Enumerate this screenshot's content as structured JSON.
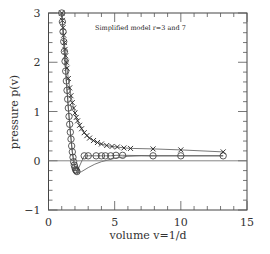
{
  "chart_data": {
    "type": "line",
    "title": "",
    "annotation": "Simplified  model r=3 and 7",
    "xlabel": "volume   v=1/d",
    "ylabel": "pressure   p(v)",
    "xlim": [
      0,
      15
    ],
    "ylim": [
      -1,
      3
    ],
    "xticks": [
      "0",
      "5",
      "10",
      "15"
    ],
    "yticks": [
      "-1",
      "0",
      "1",
      "2",
      "3"
    ],
    "grid": false,
    "legend": null,
    "series": [
      {
        "name": "r=7 (crosses)",
        "marker": "x",
        "x": [
          1.0,
          1.05,
          1.1,
          1.15,
          1.2,
          1.25,
          1.3,
          1.35,
          1.4,
          1.5,
          1.6,
          1.7,
          1.8,
          1.9,
          2.0,
          2.1,
          2.2,
          2.35,
          2.5,
          2.7,
          2.9,
          3.1,
          3.4,
          3.7,
          4.0,
          4.4,
          4.8,
          5.2,
          5.7,
          6.2,
          7.9,
          10.0,
          13.2
        ],
        "y": [
          3.0,
          2.85,
          2.7,
          2.55,
          2.4,
          2.26,
          2.13,
          2.0,
          1.88,
          1.67,
          1.48,
          1.32,
          1.18,
          1.07,
          0.97,
          0.88,
          0.81,
          0.72,
          0.65,
          0.57,
          0.51,
          0.46,
          0.41,
          0.37,
          0.34,
          0.31,
          0.29,
          0.28,
          0.26,
          0.25,
          0.24,
          0.22,
          0.18
        ]
      },
      {
        "name": "r=3 (circles)",
        "marker": "o",
        "x": [
          1.0,
          1.05,
          1.1,
          1.15,
          1.2,
          1.25,
          1.3,
          1.35,
          1.4,
          1.45,
          1.5,
          1.55,
          1.6,
          1.65,
          1.7,
          1.75,
          1.8,
          1.85,
          1.9,
          1.95,
          2.0,
          2.05,
          2.1,
          2.15,
          2.7,
          3.0,
          3.6,
          4.0,
          4.3,
          4.7,
          5.1,
          5.6,
          7.9,
          10.0,
          13.2
        ],
        "y": [
          3.0,
          2.82,
          2.62,
          2.42,
          2.22,
          2.02,
          1.82,
          1.62,
          1.43,
          1.25,
          1.07,
          0.9,
          0.74,
          0.58,
          0.44,
          0.3,
          0.18,
          0.07,
          -0.02,
          -0.09,
          -0.14,
          -0.18,
          -0.2,
          -0.22,
          0.1,
          0.1,
          0.1,
          0.1,
          0.1,
          0.1,
          0.11,
          0.11,
          0.1,
          0.1,
          0.1
        ]
      },
      {
        "name": "model curve (solid)",
        "marker": "none",
        "x": [
          1.0,
          1.2,
          1.4,
          1.6,
          1.8,
          2.0,
          2.2,
          2.5,
          3.0,
          3.5,
          4.0,
          5.0,
          6.0,
          7.0,
          8.0,
          10.0,
          13.2
        ],
        "y": [
          3.0,
          2.2,
          1.42,
          0.74,
          0.18,
          -0.14,
          -0.25,
          -0.22,
          -0.14,
          -0.07,
          -0.02,
          0.05,
          0.09,
          0.1,
          0.1,
          0.1,
          0.1
        ]
      },
      {
        "name": "zero line",
        "marker": "none",
        "x": [
          0,
          15
        ],
        "y": [
          0,
          0
        ]
      }
    ]
  }
}
